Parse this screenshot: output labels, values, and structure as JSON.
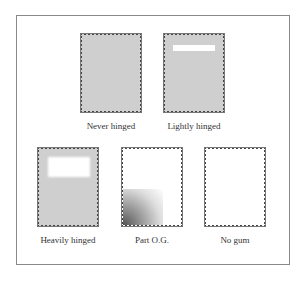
{
  "stamps": [
    {
      "label": "Never hinged",
      "style": "gray"
    },
    {
      "label": "Lightly hinged",
      "style": "gray-light-hinge"
    },
    {
      "label": "Heavily hinged",
      "style": "gray-heavy-hinge"
    },
    {
      "label": "Part O.G.",
      "style": "white-partial-gum"
    },
    {
      "label": "No gum",
      "style": "white"
    }
  ],
  "colors": {
    "gum": "#cfcfcf",
    "frame": "#8a8a8a",
    "perforation": "#444444"
  }
}
